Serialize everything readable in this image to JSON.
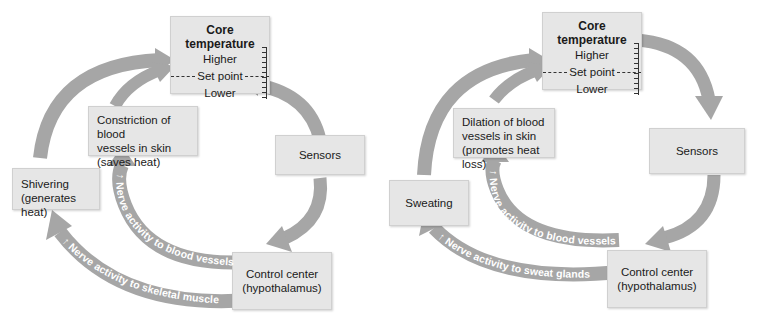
{
  "diagram": {
    "type": "thermoregulation-feedback-loops",
    "arrow_color": "#a6a6a6",
    "box_color": "#e6e6e6",
    "panels": [
      {
        "id": "cold",
        "core": {
          "title": "Core temperature",
          "higher": "Higher",
          "setpoint": "Set point",
          "lower": "Lower"
        },
        "sensors": "Sensors",
        "control_center": {
          "line1": "Control center",
          "line2": "(hypothalamus)"
        },
        "vessel_effector": {
          "line1": "Constriction of blood",
          "line2": "vessels in skin",
          "line3": "(saves heat)"
        },
        "outer_effector": {
          "line1": "Shivering",
          "line2": "(generates heat)"
        },
        "inner_arrow_label": "↑ Nerve activity to blood vessels",
        "outer_arrow_label": "↑ Nerve activity to skeletal muscle"
      },
      {
        "id": "warm",
        "core": {
          "title": "Core temperature",
          "higher": "Higher",
          "setpoint": "Set point",
          "lower": "Lower"
        },
        "sensors": "Sensors",
        "control_center": {
          "line1": "Control center",
          "line2": "(hypothalamus)"
        },
        "vessel_effector": {
          "line1": "Dilation of blood",
          "line2": "vessels in skin",
          "line3": "(promotes heat loss)"
        },
        "outer_effector": {
          "line1": "Sweating",
          "line2": ""
        },
        "inner_arrow_label": "↑ Nerve activity to blood vessels",
        "outer_arrow_label": "↑ Nerve activity to sweat glands"
      }
    ]
  }
}
